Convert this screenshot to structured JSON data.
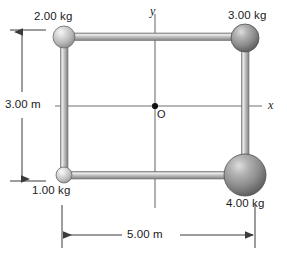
{
  "figure": {
    "background": "#ffffff"
  },
  "axes": {
    "x_label": "x",
    "y_label": "y",
    "origin_label": "O",
    "axis_color": "#6e6e6e"
  },
  "masses": [
    {
      "id": "top-left",
      "label": "2.00 kg",
      "cx": 64,
      "cy": 37,
      "r": 11,
      "tone": "light",
      "label_x": 34,
      "label_y": 10
    },
    {
      "id": "top-right",
      "label": "3.00 kg",
      "cx": 245,
      "cy": 38,
      "r": 14,
      "tone": "dark",
      "label_x": 228,
      "label_y": 9
    },
    {
      "id": "bottom-left",
      "label": "1.00 kg",
      "cx": 64,
      "cy": 175,
      "r": 8,
      "tone": "lightest",
      "label_x": 32,
      "label_y": 184
    },
    {
      "id": "bottom-right",
      "label": "4.00 kg",
      "cx": 245,
      "cy": 175,
      "r": 21,
      "tone": "dark",
      "label_x": 226,
      "label_y": 197
    }
  ],
  "rods": [
    {
      "id": "top-rod",
      "from": "top-left",
      "to": "top-right"
    },
    {
      "id": "left-rod",
      "from": "top-left",
      "to": "bottom-left"
    },
    {
      "id": "right-rod",
      "from": "top-right",
      "to": "bottom-right"
    },
    {
      "id": "bottom-rod",
      "from": "bottom-left",
      "to": "bottom-right"
    }
  ],
  "dimensions": [
    {
      "id": "height",
      "label": "3.00 m",
      "value": 3.0,
      "unit": "m",
      "orientation": "vertical",
      "label_x": 5,
      "label_y": 98
    },
    {
      "id": "width",
      "label": "5.00 m",
      "value": 5.0,
      "unit": "m",
      "orientation": "horizontal",
      "label_x": 127,
      "label_y": 228
    }
  ],
  "colors": {
    "sphere_light": "#cfcfcf",
    "sphere_dark": "#8a8a8a",
    "rod": "#b4b4b4",
    "line": "#4a4a4a",
    "text": "#1a1a1a"
  }
}
